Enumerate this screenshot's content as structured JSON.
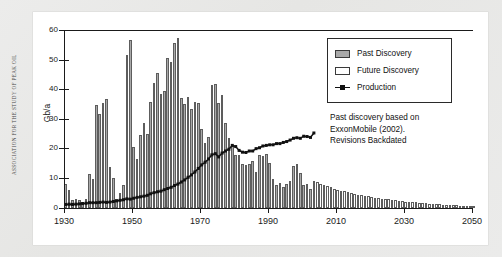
{
  "side_credit": "ASSOCIATION FOR THE STUDY OF PEAK OIL",
  "legend": {
    "items": [
      {
        "label": "Past Discovery",
        "swatch": "past"
      },
      {
        "label": "Future Discovery",
        "swatch": "future"
      },
      {
        "label": "Production",
        "swatch": "prod"
      }
    ]
  },
  "annotation": {
    "line1": "Past discovery based on",
    "line2": "ExxonMobile (2002).",
    "line3": "Revisions Backdated"
  },
  "chart_data": {
    "type": "bar",
    "title": "",
    "xlabel": "",
    "ylabel": "Gb/a",
    "xlim": [
      1930,
      2050
    ],
    "ylim": [
      0,
      60
    ],
    "ytick_labels": [
      "0",
      "10",
      "20",
      "30",
      "40",
      "50",
      "60"
    ],
    "yticks": [
      0,
      10,
      20,
      30,
      40,
      50,
      60
    ],
    "xtick_labels": [
      "1930",
      "1950",
      "1970",
      "1990",
      "2010",
      "2030",
      "2050"
    ],
    "xticks": [
      1930,
      1950,
      1970,
      1990,
      2010,
      2030,
      2050
    ],
    "grid": false,
    "legend_position": "upper-right",
    "past_future_split_year": 2003,
    "years": [
      1930,
      1931,
      1932,
      1933,
      1934,
      1935,
      1936,
      1937,
      1938,
      1939,
      1940,
      1941,
      1942,
      1943,
      1944,
      1945,
      1946,
      1947,
      1948,
      1949,
      1950,
      1951,
      1952,
      1953,
      1954,
      1955,
      1956,
      1957,
      1958,
      1959,
      1960,
      1961,
      1962,
      1963,
      1964,
      1965,
      1966,
      1967,
      1968,
      1969,
      1970,
      1971,
      1972,
      1973,
      1974,
      1975,
      1976,
      1977,
      1978,
      1979,
      1980,
      1981,
      1982,
      1983,
      1984,
      1985,
      1986,
      1987,
      1988,
      1989,
      1990,
      1991,
      1992,
      1993,
      1994,
      1995,
      1996,
      1997,
      1998,
      1999,
      2000,
      2001,
      2002,
      2003,
      2004,
      2005,
      2006,
      2007,
      2008,
      2009,
      2010,
      2011,
      2012,
      2013,
      2014,
      2015,
      2016,
      2017,
      2018,
      2019,
      2020,
      2021,
      2022,
      2023,
      2024,
      2025,
      2026,
      2027,
      2028,
      2029,
      2030,
      2031,
      2032,
      2033,
      2034,
      2035,
      2036,
      2037,
      2038,
      2039,
      2040,
      2041,
      2042,
      2043,
      2044,
      2045,
      2046,
      2047,
      2048,
      2049,
      2050
    ],
    "series": [
      {
        "name": "Past Discovery",
        "type": "bar",
        "values": [
          8.0,
          6.0,
          2.6,
          2.9,
          2.8,
          2.0,
          3.0,
          11.5,
          9.8,
          35.0,
          32.0,
          35.5,
          37.0,
          14.0,
          10.2,
          3.0,
          5.2,
          7.8,
          51.8,
          56.8,
          20.8,
          16.5,
          24.8,
          28.8,
          25.2,
          35.8,
          42.2,
          45.8,
          38.5,
          39.5,
          50.8,
          49.5,
          55.8,
          57.4,
          37.4,
          35.2,
          37.5,
          33.4,
          35.9,
          35.5,
          26.6,
          22.1,
          23.9,
          41.5,
          42.0,
          35.5,
          38.3,
          28.9,
          23.8,
          21.0,
          18.0,
          17.9,
          14.8,
          14.6,
          14.9,
          16.0,
          12.2,
          18.0,
          17.7,
          18.4,
          15.3,
          9.7,
          7.8,
          8.5,
          7.2,
          8.0,
          9.3,
          14.2,
          15.0,
          12.0,
          7.8,
          8.2,
          6.6,
          null,
          null,
          null,
          null,
          null,
          null,
          null,
          null,
          null,
          null,
          null,
          null,
          null,
          null,
          null,
          null,
          null,
          null,
          null,
          null,
          null,
          null,
          null,
          null,
          null,
          null,
          null,
          null,
          null,
          null,
          null,
          null,
          null,
          null,
          null,
          null,
          null,
          null,
          null,
          null,
          null,
          null,
          null,
          null,
          null,
          null,
          null,
          null
        ]
      },
      {
        "name": "Future Discovery",
        "type": "bar",
        "values": [
          null,
          null,
          null,
          null,
          null,
          null,
          null,
          null,
          null,
          null,
          null,
          null,
          null,
          null,
          null,
          null,
          null,
          null,
          null,
          null,
          null,
          null,
          null,
          null,
          null,
          null,
          null,
          null,
          null,
          null,
          null,
          null,
          null,
          null,
          null,
          null,
          null,
          null,
          null,
          null,
          null,
          null,
          null,
          null,
          null,
          null,
          null,
          null,
          null,
          null,
          null,
          null,
          null,
          null,
          null,
          null,
          null,
          null,
          null,
          null,
          null,
          null,
          null,
          null,
          null,
          null,
          null,
          null,
          null,
          null,
          null,
          null,
          null,
          9.0,
          8.8,
          8.3,
          7.8,
          7.4,
          7.0,
          6.6,
          6.2,
          5.9,
          5.6,
          5.3,
          5.0,
          4.8,
          4.5,
          4.3,
          4.1,
          3.9,
          3.7,
          3.5,
          3.3,
          3.2,
          3.0,
          2.9,
          2.7,
          2.6,
          2.5,
          2.3,
          2.2,
          2.1,
          2.0,
          1.9,
          1.8,
          1.7,
          1.6,
          1.5,
          1.4,
          1.3,
          1.25,
          1.15,
          1.1,
          1.0,
          0.95,
          0.9,
          0.85,
          0.8,
          0.75,
          0.7,
          0.65,
          0.6,
          0.55,
          0.5
        ]
      },
      {
        "name": "Production",
        "type": "line",
        "values": [
          1.2,
          1.3,
          1.2,
          1.3,
          1.4,
          1.5,
          1.6,
          1.8,
          1.8,
          1.8,
          1.9,
          2.0,
          1.9,
          2.0,
          2.2,
          2.4,
          2.6,
          2.8,
          3.1,
          3.0,
          3.3,
          3.6,
          3.8,
          4.0,
          4.3,
          4.8,
          5.2,
          5.5,
          5.7,
          6.2,
          6.6,
          7.0,
          7.6,
          8.1,
          8.8,
          9.5,
          10.4,
          11.2,
          12.2,
          13.4,
          14.6,
          15.5,
          16.6,
          18.0,
          18.4,
          17.3,
          18.6,
          19.3,
          19.9,
          21.2,
          20.8,
          19.5,
          18.9,
          18.8,
          19.3,
          19.3,
          20.1,
          20.4,
          21.0,
          21.2,
          21.4,
          21.4,
          21.8,
          21.8,
          22.2,
          22.5,
          23.0,
          23.6,
          23.8,
          23.6,
          24.3,
          24.2,
          23.9,
          25.4,
          null,
          null,
          null,
          null,
          null,
          null,
          null,
          null,
          null,
          null,
          null,
          null,
          null,
          null,
          null,
          null,
          null,
          null,
          null,
          null,
          null,
          null,
          null,
          null,
          null,
          null,
          null,
          null,
          null,
          null,
          null,
          null,
          null,
          null,
          null,
          null,
          null,
          null,
          null,
          null,
          null,
          null,
          null,
          null,
          null,
          null,
          null,
          null
        ]
      }
    ]
  }
}
